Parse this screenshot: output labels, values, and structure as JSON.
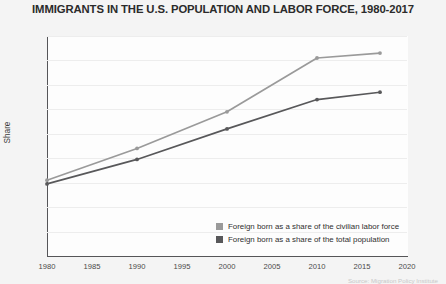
{
  "chart_data": {
    "type": "line",
    "title": "IMMIGRANTS IN THE U.S. POPULATION AND LABOR FORCE, 1980-2017",
    "xlabel": "",
    "ylabel": "Share",
    "x": [
      1980,
      1990,
      2000,
      2010,
      2017
    ],
    "xlim": [
      1980,
      2020
    ],
    "ylim": [
      0,
      18
    ],
    "xticks": [
      "1980",
      "1985",
      "1990",
      "1995",
      "2000",
      "2005",
      "2010",
      "2015",
      "2020"
    ],
    "xtick_values": [
      1980,
      1985,
      1990,
      1995,
      2000,
      2005,
      2010,
      2015,
      2020
    ],
    "yticks": [
      "0",
      "2",
      "4",
      "6",
      "8",
      "10",
      "12",
      "14",
      "16",
      "18"
    ],
    "ytick_values": [
      0,
      2,
      4,
      6,
      8,
      10,
      12,
      14,
      16,
      18
    ],
    "ytick_suffix": "%",
    "grid": "horizontal",
    "legend_position": "bottom-right",
    "series": [
      {
        "name": "Foreign born as a share of the civilian labor force",
        "color": "#9a9a9a",
        "values": [
          6.2,
          8.8,
          11.8,
          16.2,
          16.6
        ]
      },
      {
        "name": "Foreign born as a share of the total population",
        "color": "#58585a",
        "values": [
          5.9,
          7.9,
          10.4,
          12.8,
          13.4
        ]
      }
    ]
  },
  "source": {
    "note": "Source: Migration Policy Institute"
  }
}
